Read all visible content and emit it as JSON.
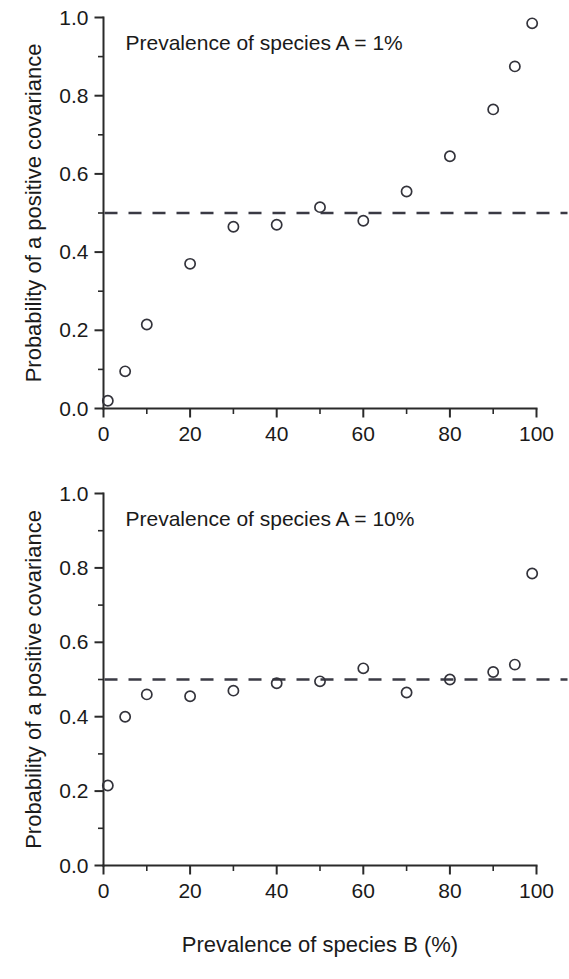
{
  "figure": {
    "width": 569,
    "height": 979,
    "background": "#ffffff",
    "ink_color": "#1a1a1a",
    "marker_color": "#33333b",
    "reference_line_color": "#3a3a44"
  },
  "axis_titles": {
    "y": "Probability of a positive covariance",
    "x": "Prevalence of species B (%)"
  },
  "chart_data": [
    {
      "type": "scatter",
      "title": "",
      "annotation": "Prevalence of species A = 1%",
      "xlabel": "",
      "ylabel": "Probability of a positive covariance",
      "xlim": [
        0,
        100
      ],
      "ylim": [
        0.0,
        1.0
      ],
      "grid": false,
      "legend": "none",
      "marker": "open-circle",
      "x_major_ticks": [
        0,
        20,
        40,
        60,
        80,
        100
      ],
      "x_tick_labels": [
        "0",
        "20",
        "40",
        "60",
        "80",
        "100"
      ],
      "x_minor_ticks": [
        10,
        30,
        50,
        70,
        90
      ],
      "y_major_ticks": [
        0.0,
        0.2,
        0.4,
        0.6,
        0.8,
        1.0
      ],
      "y_tick_labels": [
        "0.0",
        "0.2",
        "0.4",
        "0.6",
        "0.8",
        "1.0"
      ],
      "y_minor_ticks": [
        0.1,
        0.3,
        0.5,
        0.7,
        0.9
      ],
      "reference_line": {
        "orientation": "horizontal",
        "y": 0.5,
        "style": "dashed"
      },
      "x": [
        1,
        5,
        10,
        20,
        30,
        40,
        50,
        60,
        70,
        80,
        90,
        95,
        99
      ],
      "values": [
        0.02,
        0.095,
        0.215,
        0.37,
        0.465,
        0.47,
        0.515,
        0.48,
        0.555,
        0.645,
        0.765,
        0.875,
        0.985
      ]
    },
    {
      "type": "scatter",
      "title": "",
      "annotation": "Prevalence of species A = 10%",
      "xlabel": "Prevalence of species B (%)",
      "ylabel": "Probability of a positive covariance",
      "xlim": [
        0,
        100
      ],
      "ylim": [
        0.0,
        1.0
      ],
      "grid": false,
      "legend": "none",
      "marker": "open-circle",
      "x_major_ticks": [
        0,
        20,
        40,
        60,
        80,
        100
      ],
      "x_tick_labels": [
        "0",
        "20",
        "40",
        "60",
        "80",
        "100"
      ],
      "x_minor_ticks": [
        10,
        30,
        50,
        70,
        90
      ],
      "y_major_ticks": [
        0.0,
        0.2,
        0.4,
        0.6,
        0.8,
        1.0
      ],
      "y_tick_labels": [
        "0.0",
        "0.2",
        "0.4",
        "0.6",
        "0.8",
        "1.0"
      ],
      "y_minor_ticks": [
        0.1,
        0.3,
        0.5,
        0.7,
        0.9
      ],
      "reference_line": {
        "orientation": "horizontal",
        "y": 0.5,
        "style": "dashed"
      },
      "x": [
        1,
        5,
        10,
        20,
        30,
        40,
        50,
        60,
        70,
        80,
        90,
        95,
        99
      ],
      "values": [
        0.215,
        0.4,
        0.46,
        0.455,
        0.47,
        0.49,
        0.495,
        0.53,
        0.465,
        0.5,
        0.52,
        0.54,
        0.785
      ]
    }
  ]
}
